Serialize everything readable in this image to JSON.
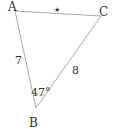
{
  "diagram": {
    "type": "triangle",
    "vertices": {
      "A": {
        "label": "A",
        "x": 15,
        "y": 11
      },
      "B": {
        "label": "B",
        "x": 36,
        "y": 108
      },
      "C": {
        "label": "C",
        "x": 101,
        "y": 16
      }
    },
    "sides": {
      "AB": {
        "label": "7"
      },
      "BC": {
        "label": "8"
      },
      "AC": {
        "label": "★"
      }
    },
    "angles": {
      "B": {
        "label": "47°"
      }
    },
    "colors": {
      "stroke": "#aaaaaa",
      "text": "#333333",
      "background": "#ffffff"
    }
  }
}
